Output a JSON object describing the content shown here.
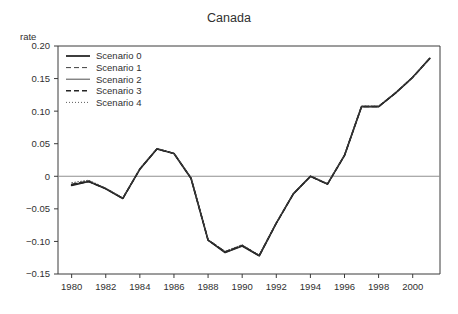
{
  "chart_data": {
    "type": "line",
    "title": "Canada",
    "xlabel": "",
    "ylabel": "rate",
    "xlim": [
      1979.2,
      2001.6
    ],
    "ylim": [
      -0.15,
      0.2
    ],
    "grid": false,
    "legend_position": "top-left",
    "x_ticks": [
      1980,
      1982,
      1984,
      1986,
      1988,
      1990,
      1992,
      1994,
      1996,
      1998,
      2000
    ],
    "x_tick_labels": [
      "1980",
      "1982",
      "1984",
      "1986",
      "1988",
      "1990",
      "1992",
      "1994",
      "1996",
      "1998",
      "2000"
    ],
    "y_ticks": [
      -0.15,
      -0.1,
      -0.05,
      0,
      0.05,
      0.1,
      0.15,
      0.2
    ],
    "y_tick_labels": [
      "−0.15",
      "−0.10",
      "−0.05",
      "0",
      "0.05",
      "0.10",
      "0.15",
      "0.20"
    ],
    "x": [
      1980,
      1981,
      1982,
      1983,
      1984,
      1985,
      1986,
      1987,
      1988,
      1989,
      1990,
      1991,
      1992,
      1993,
      1994,
      1995,
      1996,
      1997,
      1998,
      1999,
      2000,
      2001
    ],
    "series": [
      {
        "name": "Scenario 0",
        "style": "solid",
        "width": 1.7,
        "color": "#1a1a1a",
        "values": [
          -0.014,
          -0.008,
          -0.019,
          -0.034,
          0.011,
          0.042,
          0.035,
          -0.003,
          -0.098,
          -0.117,
          -0.107,
          -0.122,
          -0.072,
          -0.027,
          0.0,
          -0.012,
          0.032,
          0.107,
          0.107,
          0.128,
          0.152,
          0.181
        ]
      },
      {
        "name": "Scenario 1",
        "style": "dashed",
        "width": 0.9,
        "color": "#2a2a2a",
        "values": [
          -0.012,
          -0.007,
          -0.019,
          -0.034,
          0.011,
          0.042,
          0.035,
          -0.003,
          -0.097,
          -0.116,
          -0.106,
          -0.121,
          -0.072,
          -0.027,
          0.0,
          -0.012,
          0.032,
          0.107,
          0.107,
          0.128,
          0.152,
          0.181
        ]
      },
      {
        "name": "Scenario 2",
        "style": "solid-thin",
        "width": 0.9,
        "color": "#3a3a3a",
        "values": [
          -0.013,
          -0.008,
          -0.019,
          -0.034,
          0.011,
          0.042,
          0.035,
          -0.003,
          -0.098,
          -0.117,
          -0.107,
          -0.122,
          -0.072,
          -0.027,
          0.0,
          -0.012,
          0.032,
          0.107,
          0.107,
          0.128,
          0.152,
          0.181
        ]
      },
      {
        "name": "Scenario 3",
        "style": "dashed-bold",
        "width": 1.5,
        "color": "#252525",
        "values": [
          -0.013,
          -0.008,
          -0.019,
          -0.034,
          0.011,
          0.042,
          0.035,
          -0.003,
          -0.098,
          -0.116,
          -0.106,
          -0.122,
          -0.072,
          -0.027,
          0.0,
          -0.012,
          0.032,
          0.107,
          0.107,
          0.128,
          0.152,
          0.181
        ]
      },
      {
        "name": "Scenario 4",
        "style": "dotted",
        "width": 0.9,
        "color": "#4a4a4a",
        "values": [
          -0.01,
          -0.006,
          -0.018,
          -0.033,
          0.012,
          0.043,
          0.035,
          -0.002,
          -0.097,
          -0.115,
          -0.105,
          -0.121,
          -0.071,
          -0.026,
          0.001,
          -0.011,
          0.033,
          0.108,
          0.108,
          0.129,
          0.152,
          0.181
        ]
      }
    ]
  },
  "legend": {
    "entries": [
      {
        "label": "Scenario 0"
      },
      {
        "label": "Scenario 1"
      },
      {
        "label": "Scenario 2"
      },
      {
        "label": "Scenario 3"
      },
      {
        "label": "Scenario 4"
      }
    ]
  }
}
